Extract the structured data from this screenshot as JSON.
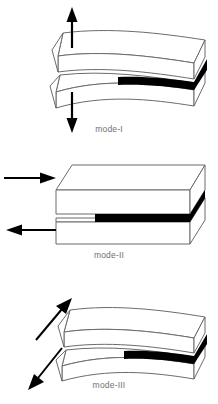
{
  "figure": {
    "background_color": "#ffffff",
    "outline_color": "#6b6b6b",
    "crack_color": "#000000",
    "arrow_color": "#000000",
    "label_color": "#6f6f6f",
    "face_color": "#ffffff"
  },
  "panels": [
    {
      "id": "mode-1",
      "label": "mode-I",
      "description": "Opening mode: two curved plates pulled apart normal to the crack plane",
      "geometry": "curved-warped-plates",
      "arrows": [
        {
          "name": "upward-tension-arrow",
          "direction": "up",
          "x": 72,
          "y_from": 48,
          "y_to": 12
        },
        {
          "name": "downward-tension-arrow",
          "direction": "down",
          "x": 72,
          "y_from": 92,
          "y_to": 128
        }
      ]
    },
    {
      "id": "mode-2",
      "label": "mode-II",
      "description": "Sliding shear mode: flat block halves sheared in-plane in opposite directions",
      "geometry": "flat-straight-block",
      "arrows": [
        {
          "name": "upper-shear-arrow-right",
          "direction": "right",
          "y": 38,
          "x_from": 4,
          "x_to": 52
        },
        {
          "name": "lower-shear-arrow-left",
          "direction": "left",
          "y": 88,
          "x_from": 56,
          "x_to": 6
        }
      ]
    },
    {
      "id": "mode-3",
      "label": "mode-III",
      "description": "Tearing mode: curved plates displaced anti-plane along diagonal directions",
      "geometry": "curved-warped-plates",
      "arrows": [
        {
          "name": "upper-tearing-arrow-up-right",
          "direction": "up-right",
          "x_from": 36,
          "y_from": 60,
          "x_to": 68,
          "y_to": 22
        },
        {
          "name": "lower-tearing-arrow-down-left",
          "direction": "down-left",
          "x_from": 62,
          "y_from": 68,
          "x_to": 32,
          "y_to": 104
        }
      ]
    }
  ]
}
